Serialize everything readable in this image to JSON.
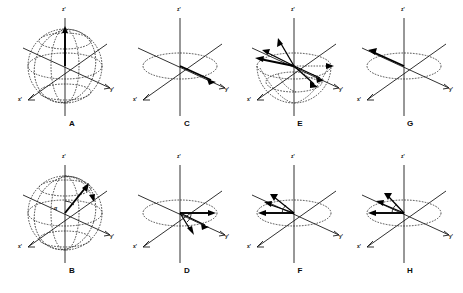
{
  "figure": {
    "background_color": "#ffffff",
    "line_color": "#1a1a1a",
    "vector_color": "#000000",
    "panel_count": 8,
    "columns": 4,
    "rows": 2
  },
  "axes": {
    "z_label": "z'",
    "x_label": "x'",
    "y_label": "y'"
  },
  "panels": [
    {
      "id": "A",
      "letter": "A",
      "row": 1,
      "column": 1,
      "description": "equilibrium magnetization along +z' inside sphere",
      "has_sphere": true,
      "has_equator_ellipse": true,
      "vector_count": 1,
      "vectors": [
        {
          "name": "M0",
          "direction": "+z'",
          "angle_deg": 90,
          "length": 1.0
        }
      ],
      "angle_label": "",
      "axis_labels": {
        "z": "z'",
        "x": "x'",
        "y": "y'"
      }
    },
    {
      "id": "B",
      "letter": "B",
      "row": 2,
      "column": 1,
      "description": "magnetization tipped by flip angle alpha toward transverse plane",
      "has_sphere": true,
      "has_equator_ellipse": true,
      "vector_count": 1,
      "vectors": [
        {
          "name": "M",
          "direction": "tipped",
          "angle_deg": 55,
          "length": 1.0
        }
      ],
      "angle_label": "α",
      "axis_labels": {
        "z": "z'",
        "x": "x'",
        "y": "y'"
      }
    },
    {
      "id": "C",
      "letter": "C",
      "row": 1,
      "column": 2,
      "description": "magnetization fully in transverse plane along +y'",
      "has_sphere": false,
      "has_equator_ellipse": true,
      "vector_count": 1,
      "vectors": [
        {
          "name": "Mxy",
          "direction": "+y'",
          "angle_deg": 0,
          "length": 1.0
        }
      ],
      "angle_label": "",
      "axis_labels": {
        "z": "z'",
        "x": "x'",
        "y": "y'"
      }
    },
    {
      "id": "D",
      "letter": "D",
      "row": 2,
      "column": 2,
      "description": "isochromats begin to dephase, fanning clockwise from +y'",
      "has_sphere": false,
      "has_equator_ellipse": true,
      "vector_count": 3,
      "vectors": [
        {
          "name": "iso-1",
          "direction": "+y'",
          "angle_deg": 0,
          "length": 1.0
        },
        {
          "name": "iso-2",
          "direction": "lagging",
          "angle_deg": -22,
          "length": 0.92
        },
        {
          "name": "iso-3",
          "direction": "lagging",
          "angle_deg": -45,
          "length": 0.82
        }
      ],
      "angle_label": "",
      "axis_labels": {
        "z": "z'",
        "x": "x'",
        "y": "y'"
      }
    },
    {
      "id": "E",
      "letter": "E",
      "row": 1,
      "column": 3,
      "description": "180 degree refocusing pulse flips the fan of isochromats",
      "has_sphere": true,
      "has_equator_ellipse": true,
      "vector_count": 5,
      "vectors": [
        {
          "name": "iso-1",
          "direction": "-y'",
          "angle_deg": 180,
          "length": 1.0
        },
        {
          "name": "iso-2",
          "direction": "upper-left",
          "angle_deg": 150,
          "length": 0.95
        },
        {
          "name": "iso-3",
          "direction": "up",
          "angle_deg": 110,
          "length": 0.9
        },
        {
          "name": "iso-4",
          "direction": "lower-right",
          "angle_deg": -30,
          "length": 0.9
        },
        {
          "name": "iso-5",
          "direction": "+y'",
          "angle_deg": 0,
          "length": 1.0
        }
      ],
      "angle_label": "",
      "axis_labels": {
        "z": "z'",
        "x": "x'",
        "y": "y'"
      }
    },
    {
      "id": "F",
      "letter": "F",
      "row": 2,
      "column": 3,
      "description": "isochromats rephasing toward -y' after the refocusing pulse",
      "has_sphere": false,
      "has_equator_ellipse": true,
      "vector_count": 3,
      "vectors": [
        {
          "name": "iso-1",
          "direction": "-y'",
          "angle_deg": 180,
          "length": 1.0
        },
        {
          "name": "iso-2",
          "direction": "upper-left",
          "angle_deg": 158,
          "length": 0.92
        },
        {
          "name": "iso-3",
          "direction": "upper-left",
          "angle_deg": 138,
          "length": 0.85
        }
      ],
      "angle_label": "",
      "axis_labels": {
        "z": "z'",
        "x": "x'",
        "y": "y'"
      }
    },
    {
      "id": "G",
      "letter": "G",
      "row": 1,
      "column": 4,
      "description": "fully refocused echo, magnetization along -y'",
      "has_sphere": false,
      "has_equator_ellipse": true,
      "vector_count": 1,
      "vectors": [
        {
          "name": "Mxy",
          "direction": "-y'",
          "angle_deg": 180,
          "length": 1.0
        }
      ],
      "angle_label": "",
      "axis_labels": {
        "z": "z'",
        "x": "x'",
        "y": "y'"
      }
    },
    {
      "id": "H",
      "letter": "H",
      "row": 2,
      "column": 4,
      "description": "isochromats converging on -y' just before the echo peak",
      "has_sphere": false,
      "has_equator_ellipse": true,
      "vector_count": 3,
      "vectors": [
        {
          "name": "iso-1",
          "direction": "-y'",
          "angle_deg": 180,
          "length": 1.0
        },
        {
          "name": "iso-2",
          "direction": "upper-left",
          "angle_deg": 160,
          "length": 0.93
        },
        {
          "name": "iso-3",
          "direction": "upper-left",
          "angle_deg": 142,
          "length": 0.86
        }
      ],
      "angle_label": "",
      "axis_labels": {
        "z": "z'",
        "x": "x'",
        "y": "y'"
      }
    }
  ]
}
